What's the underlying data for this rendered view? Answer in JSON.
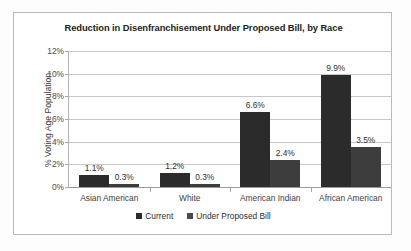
{
  "chart_data": {
    "type": "bar",
    "title": "Reduction in Disenfranchisement Under Proposed Bill, by Race",
    "xlabel": "",
    "ylabel": "% Voting Age Population",
    "categories": [
      "Asian American",
      "White",
      "American Indian",
      "African American"
    ],
    "series": [
      {
        "name": "Current",
        "color": "#2b2b2b",
        "values": [
          1.1,
          1.2,
          6.6,
          9.9
        ],
        "labels": [
          "1.1%",
          "1.2%",
          "6.6%",
          "9.9%"
        ]
      },
      {
        "name": "Under Proposed Bill",
        "color": "#3d3d3d",
        "values": [
          0.3,
          0.3,
          2.4,
          3.5
        ],
        "labels": [
          "0.3%",
          "0.3%",
          "2.4%",
          "3.5%"
        ]
      }
    ],
    "ylim": [
      0,
      12
    ],
    "ytick_values": [
      0,
      2,
      4,
      6,
      8,
      10,
      12
    ],
    "ytick_labels": [
      "0%",
      "2%",
      "4%",
      "6%",
      "8%",
      "10%",
      "12%"
    ],
    "grid": true,
    "legend_position": "bottom"
  }
}
